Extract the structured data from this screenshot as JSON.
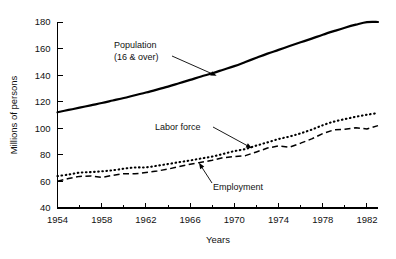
{
  "chart_data": {
    "type": "line",
    "title": "",
    "xlabel": "Years",
    "ylabel": "Millions of persons",
    "xlim": [
      1954,
      1983
    ],
    "ylim": [
      40,
      180
    ],
    "grid": false,
    "legend_position": "inline-annotations",
    "x_major_ticks": [
      1954,
      1958,
      1962,
      1966,
      1970,
      1974,
      1978,
      1982
    ],
    "x_major_tick_labels": [
      "1954",
      "1958",
      "1962",
      "1966",
      "1970",
      "1974",
      "1978",
      "1982"
    ],
    "x_minor_ticks": [
      1956,
      1960,
      1964,
      1968,
      1972,
      1976,
      1980
    ],
    "y_ticks": [
      40,
      60,
      80,
      100,
      120,
      140,
      160,
      180
    ],
    "y_tick_labels": [
      "40",
      "60",
      "80",
      "100",
      "120",
      "140",
      "160",
      "180"
    ],
    "x": [
      1954,
      1955,
      1956,
      1957,
      1958,
      1959,
      1960,
      1961,
      1962,
      1963,
      1964,
      1965,
      1966,
      1967,
      1968,
      1969,
      1970,
      1971,
      1972,
      1973,
      1974,
      1975,
      1976,
      1977,
      1978,
      1979,
      1980,
      1981,
      1982,
      1983
    ],
    "series": [
      {
        "name": "Population (16 & over)",
        "style": "solid",
        "values": [
          112.1,
          113.8,
          115.5,
          117.3,
          119.0,
          120.9,
          122.8,
          124.9,
          126.9,
          129.1,
          131.4,
          133.9,
          136.4,
          139.0,
          141.4,
          144.1,
          146.8,
          149.9,
          153.1,
          156.2,
          159.0,
          161.9,
          164.7,
          167.5,
          170.4,
          173.1,
          175.7,
          178.0,
          179.9,
          180.0
        ]
      },
      {
        "name": "Labor force",
        "style": "dotted",
        "values": [
          64.0,
          65.2,
          66.6,
          67.0,
          67.6,
          68.4,
          69.6,
          70.5,
          70.6,
          71.8,
          73.1,
          74.5,
          75.8,
          77.3,
          78.7,
          80.7,
          82.8,
          84.4,
          87.0,
          89.4,
          91.9,
          93.8,
          96.2,
          99.0,
          102.3,
          105.0,
          106.9,
          108.7,
          110.2,
          111.5
        ]
      },
      {
        "name": "Employment",
        "style": "dashed",
        "values": [
          60.1,
          62.2,
          63.8,
          64.1,
          63.0,
          64.6,
          65.8,
          65.7,
          66.7,
          67.8,
          69.3,
          71.1,
          72.9,
          74.4,
          75.9,
          77.9,
          78.7,
          79.4,
          82.2,
          85.1,
          86.8,
          85.8,
          88.8,
          92.0,
          96.0,
          98.8,
          99.3,
          100.4,
          99.5,
          102.0
        ]
      }
    ],
    "annotations": [
      {
        "name": "population-annotation",
        "lines": [
          "Population",
          "(16 & over)"
        ],
        "text": "Population (16 & over)",
        "target_x": 1968.4,
        "target_y": 139.5
      },
      {
        "name": "labor-force-annotation",
        "lines": [
          "Labor force"
        ],
        "text": "Labor force",
        "target_x": 1971.6,
        "target_y": 85.0
      },
      {
        "name": "employment-annotation",
        "lines": [
          "Employment"
        ],
        "text": "Employment",
        "target_x": 1966.8,
        "target_y": 74.0
      }
    ]
  }
}
